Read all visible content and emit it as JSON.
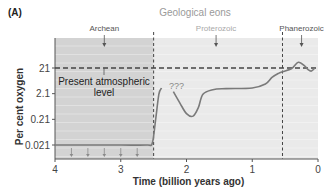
{
  "panel_label": "(A)",
  "title": "Geological eons",
  "eons": [
    {
      "name": "Archean",
      "label_x": 4.05,
      "arrow_x": 3.25
    },
    {
      "name": "Proterozoic",
      "label_x": 1.55,
      "arrow_x": 1.55
    },
    {
      "name": "Phanerozoic",
      "label_x": 0.25,
      "arrow_x": 0.25
    }
  ],
  "annotations": {
    "present_level": [
      "Present atmospheric",
      "level"
    ],
    "unknown": "???"
  },
  "colors": {
    "archean_fill": "#d3d3d3",
    "later_fill": "#eaeaea",
    "curve": "#7a7a7a",
    "axis": "#555555",
    "dashed": "#444444",
    "title_text": "#9a9a9a",
    "eon_text": "#555555",
    "proterozoic_text": "#a8a8a8"
  },
  "chart_data": {
    "type": "line",
    "title": "Geological eons",
    "xlabel": "Time (billion years ago)",
    "ylabel": "Per cent oxygen",
    "xlim": [
      4,
      0
    ],
    "yscale": "log",
    "ylim": [
      0.01,
      80
    ],
    "x_ticks": [
      4,
      3,
      2,
      1,
      0
    ],
    "x_tick_labels": [
      "4",
      "3",
      "2",
      "1",
      "0"
    ],
    "y_ticks": [
      21,
      2.1,
      0.21,
      0.021
    ],
    "y_tick_labels": [
      "21",
      "2.1",
      "0.21",
      "0.021"
    ],
    "reference_line": {
      "y": 21,
      "label": "Present atmospheric level",
      "style": "dashed"
    },
    "eon_boundaries": [
      2.5,
      0.54
    ],
    "series": [
      {
        "name": "Oxygen level (segment 1)",
        "x": [
          4.0,
          3.5,
          3.0,
          2.6,
          2.52,
          2.47,
          2.42,
          2.38
        ],
        "y": [
          0.021,
          0.021,
          0.021,
          0.021,
          0.025,
          0.2,
          2.0,
          3.5
        ]
      },
      {
        "name": "Oxygen level (segment 2)",
        "x": [
          2.2,
          2.1,
          2.0,
          1.9,
          1.82,
          1.75,
          1.6,
          1.4,
          1.0,
          0.8,
          0.7,
          0.6,
          0.54,
          0.4,
          0.3,
          0.2,
          0.15,
          0.1,
          0.05
        ],
        "y": [
          2.5,
          0.9,
          0.35,
          0.28,
          0.6,
          2.0,
          3.0,
          3.3,
          3.5,
          5,
          9,
          13,
          15,
          20,
          35,
          25,
          18,
          16,
          21
        ]
      }
    ],
    "markers": {
      "type": "down-arrows",
      "x": [
        3.75,
        3.5,
        3.25,
        3.0,
        2.75
      ],
      "note": "arrows indicating upper limit in Archean"
    },
    "annotations": [
      "Present atmospheric level",
      "???"
    ],
    "grid": "horizontal light lines"
  }
}
